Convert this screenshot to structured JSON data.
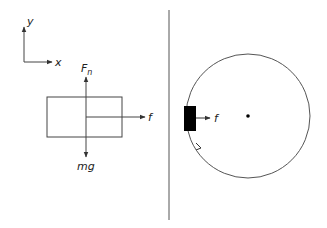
{
  "diagram": {
    "type": "physics-free-body-diagram",
    "left_panel": {
      "axes": {
        "x_label": "x",
        "y_label": "y"
      },
      "forces": {
        "normal": {
          "label_main": "F",
          "label_sub": "n"
        },
        "gravity": {
          "label": "mg"
        },
        "friction": {
          "label": "f"
        }
      }
    },
    "right_panel": {
      "friction": {
        "label": "f"
      },
      "description": "block on inside of rotating circle, moving along circular path"
    },
    "colors": {
      "line": "#444444",
      "block_fill": "#000000",
      "background": "#ffffff"
    }
  }
}
